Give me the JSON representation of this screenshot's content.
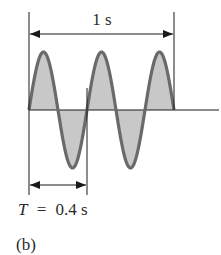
{
  "figure": {
    "span_label": "1 s",
    "period_label_var": "T",
    "period_label_eq": "=",
    "period_label_val": "0.4 s",
    "caption": "(b)",
    "colors": {
      "line": "#1a1a1a",
      "wave_stroke": "#6a6a6a",
      "wave_fill": "#c8c8c8"
    }
  },
  "chart_data": {
    "type": "line",
    "title": "",
    "total_time_s": 1,
    "period_s": 0.4,
    "cycles": 2.5,
    "annotations": [
      "1 s",
      "T = 0.4 s",
      "(b)"
    ],
    "xlabel": "",
    "ylabel": ""
  }
}
